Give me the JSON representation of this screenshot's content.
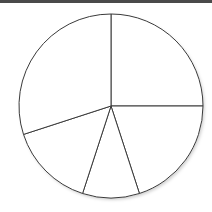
{
  "chart_data": {
    "type": "pie",
    "title": "",
    "categories": [
      "Slice A",
      "Slice B",
      "Slice C",
      "Slice D",
      "Slice E"
    ],
    "values": [
      25,
      20,
      10,
      15,
      30
    ],
    "start_angle_deg": 90,
    "direction": "clockwise",
    "legend": "none",
    "labels_shown": false
  },
  "style": {
    "topbar_color": "#4a4a4a",
    "fill_color": "#ffffff",
    "stroke_color": "#3a3a3a",
    "center": [
      111,
      106
    ],
    "radius": 92
  }
}
